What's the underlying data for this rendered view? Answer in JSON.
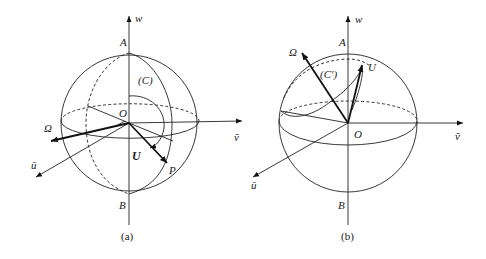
{
  "figure_a": {
    "caption": "(a)",
    "axes": {
      "w": "w",
      "v": "ṽ",
      "u": "ū"
    },
    "points": {
      "top": "A",
      "bottom": "B",
      "origin": "O",
      "p": "P"
    },
    "curve_label": "(C)",
    "vectors": {
      "omega": "Ω",
      "u_vec": "U"
    }
  },
  "figure_b": {
    "caption": "(b)",
    "axes": {
      "w": "w",
      "v": "ṽ",
      "u": "ū"
    },
    "points": {
      "top": "A",
      "bottom": "B",
      "origin": "O"
    },
    "curve_label": "(C′)",
    "vectors": {
      "omega": "Ω",
      "u_vec": "U"
    }
  },
  "colors": {
    "stroke": "#222222",
    "background": "#ffffff"
  }
}
